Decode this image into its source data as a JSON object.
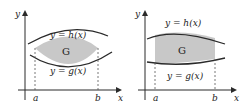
{
  "figures": [
    {
      "name": "left",
      "y_axis": "y",
      "x_axis": "x",
      "upper_curve": "y = h(x)",
      "lower_curve": "y = g(x)",
      "region": "G",
      "a": "a",
      "b": "b"
    },
    {
      "name": "right",
      "y_axis": "y",
      "x_axis": "x",
      "upper_curve": "y = h(x)",
      "lower_curve": "y = g(x)",
      "region": "G",
      "a": "a",
      "b": "b"
    }
  ],
  "colors": {
    "fill": "#c8c8c8",
    "stroke": "#2a2a2a"
  }
}
